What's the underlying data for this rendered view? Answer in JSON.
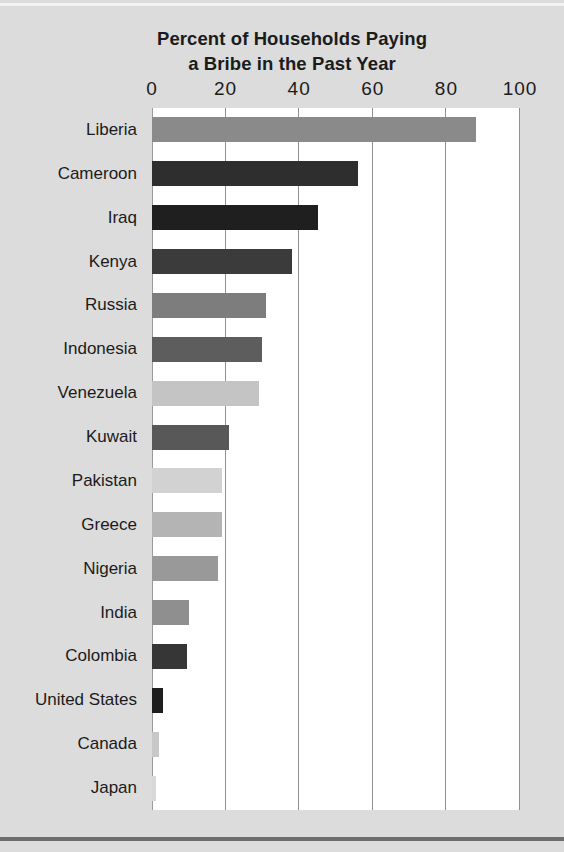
{
  "chart_data": {
    "type": "bar",
    "orientation": "horizontal",
    "title": "Percent of Households Paying a Bribe in the Past Year",
    "title_line1": "Percent of Households Paying",
    "title_line2": "a Bribe in the Past Year",
    "xlabel": "",
    "ylabel": "",
    "xlim": [
      0,
      100
    ],
    "xticks": [
      0,
      20,
      40,
      60,
      80,
      100
    ],
    "xtick_labels": [
      "0",
      "20",
      "40",
      "60",
      "80",
      "100"
    ],
    "grid": "vertical",
    "legend": "none",
    "categories": [
      "Liberia",
      "Cameroon",
      "Iraq",
      "Kenya",
      "Russia",
      "Indonesia",
      "Venezuela",
      "Kuwait",
      "Pakistan",
      "Greece",
      "Nigeria",
      "India",
      "Colombia",
      "United States",
      "Canada",
      "Japan"
    ],
    "values": [
      88,
      56,
      45,
      38,
      31,
      30,
      29,
      21,
      19,
      19,
      18,
      10,
      9.5,
      3,
      2,
      1
    ],
    "bar_colors": [
      "#8a8a8a",
      "#2e2e2e",
      "#1f1f1f",
      "#3b3b3b",
      "#7d7d7d",
      "#5d5d5d",
      "#c4c4c4",
      "#585858",
      "#d2d2d2",
      "#b4b4b4",
      "#999999",
      "#8f8f8f",
      "#363636",
      "#1e1e1e",
      "#c8c8c8",
      "#d8d8d8"
    ],
    "bars": [
      {
        "label": "Liberia",
        "value": 88,
        "color": "#8a8a8a"
      },
      {
        "label": "Cameroon",
        "value": 56,
        "color": "#2e2e2e"
      },
      {
        "label": "Iraq",
        "value": 45,
        "color": "#1f1f1f"
      },
      {
        "label": "Kenya",
        "value": 38,
        "color": "#3b3b3b"
      },
      {
        "label": "Russia",
        "value": 31,
        "color": "#7d7d7d"
      },
      {
        "label": "Indonesia",
        "value": 30,
        "color": "#5d5d5d"
      },
      {
        "label": "Venezuela",
        "value": 29,
        "color": "#c4c4c4"
      },
      {
        "label": "Kuwait",
        "value": 21,
        "color": "#585858"
      },
      {
        "label": "Pakistan",
        "value": 19,
        "color": "#d2d2d2"
      },
      {
        "label": "Greece",
        "value": 19,
        "color": "#b4b4b4"
      },
      {
        "label": "Nigeria",
        "value": 18,
        "color": "#999999"
      },
      {
        "label": "India",
        "value": 10,
        "color": "#8f8f8f"
      },
      {
        "label": "Colombia",
        "value": 9.5,
        "color": "#363636"
      },
      {
        "label": "United States",
        "value": 3,
        "color": "#1e1e1e"
      },
      {
        "label": "Canada",
        "value": 2,
        "color": "#c8c8c8"
      },
      {
        "label": "Japan",
        "value": 1,
        "color": "#d8d8d8"
      }
    ]
  },
  "colors": {
    "page_background": "#dcdcdc",
    "plot_background": "#ffffff",
    "gridline": "#909090",
    "text": "#1b1b1b",
    "bottom_rule": "#6e6e6e",
    "top_rule": "#f2f2f2"
  }
}
